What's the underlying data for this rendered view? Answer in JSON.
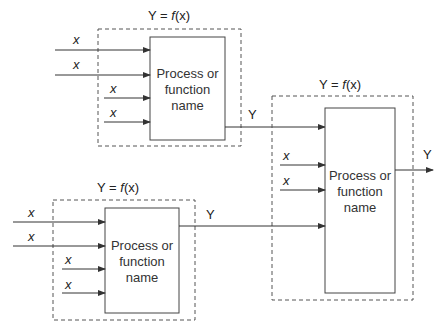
{
  "diagram": {
    "blocks": [
      {
        "id": "top-left",
        "title": "Y = f(x)",
        "process_label_lines": [
          "Process or",
          "function",
          "name"
        ],
        "inputs": [
          "x",
          "x",
          "x",
          "x"
        ],
        "output": "Y"
      },
      {
        "id": "bottom-left",
        "title": "Y = f(x)",
        "process_label_lines": [
          "Process or",
          "function",
          "name"
        ],
        "inputs": [
          "x",
          "x",
          "x",
          "x"
        ],
        "output": "Y"
      },
      {
        "id": "right",
        "title": "Y = f(x)",
        "process_label_lines": [
          "Process or",
          "function",
          "name"
        ],
        "inputs": [
          "Y",
          "x",
          "x",
          "Y"
        ],
        "output": "Y"
      }
    ],
    "title_prefix": "Y = ",
    "title_f": "f",
    "title_suffix": "(x)",
    "input_label": "x",
    "output_label": "Y",
    "colors": {
      "line": "#333333",
      "dash": "#555555",
      "text": "#222222"
    }
  }
}
